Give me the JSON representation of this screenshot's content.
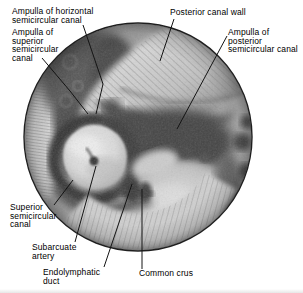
{
  "figure": {
    "callouts": [
      {
        "id": "ampulla-horizontal-canal",
        "text": "Ampulla of horizontal\nsemicircular canal"
      },
      {
        "id": "ampulla-superior-canal",
        "text": "Ampulla of\nsuperior\nsemicircular\ncanal"
      },
      {
        "id": "posterior-canal-wall",
        "text": "Posterior canal wall"
      },
      {
        "id": "ampulla-posterior-canal",
        "text": "Ampulla of\nposterior\nsemicircular canal"
      },
      {
        "id": "superior-semicircular-canal",
        "text": "Superior\nsemicircular\ncanal"
      },
      {
        "id": "subarcuate-artery",
        "text": "Subarcuate\nartery"
      },
      {
        "id": "endolymphatic-duct",
        "text": "Endolymphatic\nduct"
      },
      {
        "id": "common-crus",
        "text": "Common crus"
      }
    ]
  },
  "colors": {
    "background": "#ffffff",
    "label-text": "#000000",
    "ink": "#141414",
    "rim": "#1f1f1f",
    "photo-light": "#d8d8d8",
    "photo-mid": "#a0a0a0",
    "photo-dark": "#3c3c3c"
  }
}
